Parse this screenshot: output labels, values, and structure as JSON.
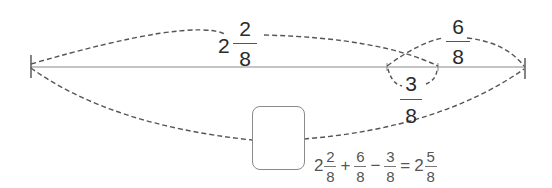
{
  "diagram": {
    "number_line": {
      "start_tick": "left-endpoint",
      "end_tick": "right-endpoint",
      "line_color": "#aaaaaa",
      "curve_color": "#555555"
    },
    "arcs": [
      {
        "id": "arc-top-whole",
        "whole": "2",
        "numerator": "2",
        "denominator": "8"
      },
      {
        "id": "arc-add",
        "whole": "",
        "numerator": "6",
        "denominator": "8"
      },
      {
        "id": "arc-subtract",
        "whole": "",
        "numerator": "3",
        "denominator": "8"
      },
      {
        "id": "arc-bottom-total",
        "label": "answer box (blank)"
      }
    ],
    "labels": {
      "top_whole": "2",
      "top_num": "2",
      "top_den": "8",
      "add_num": "6",
      "add_den": "8",
      "sub_num": "3",
      "sub_den": "8"
    },
    "equation": {
      "t1_whole": "2",
      "t1_num": "2",
      "t1_den": "8",
      "op1": "+",
      "t2_num": "6",
      "t2_den": "8",
      "op2": "−",
      "t3_num": "3",
      "t3_den": "8",
      "eq": "=",
      "r_whole": "2",
      "r_num": "5",
      "r_den": "8"
    }
  }
}
